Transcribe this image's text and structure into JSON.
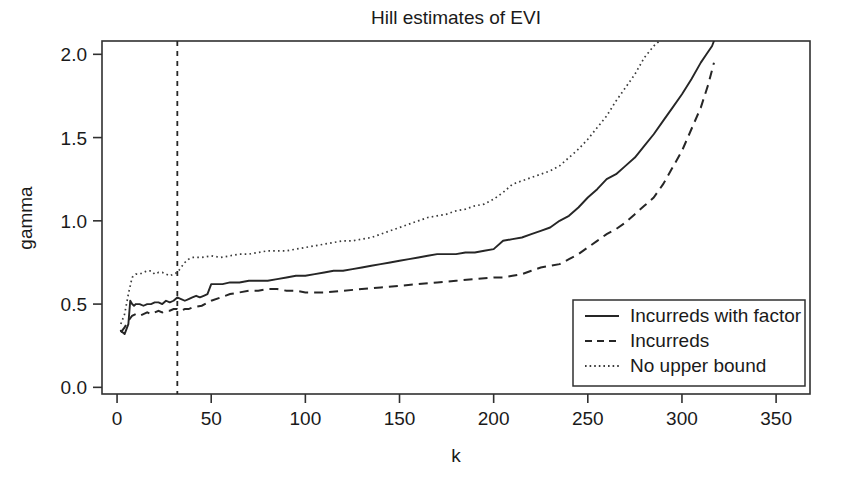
{
  "chart_data": {
    "type": "line",
    "title": "Hill estimates of EVI",
    "xlabel": "k",
    "ylabel": "gamma",
    "xlim": [
      -8,
      368
    ],
    "ylim": [
      -0.04,
      2.08
    ],
    "xticks": [
      0,
      50,
      100,
      150,
      200,
      250,
      300,
      350
    ],
    "xtick_labels": [
      "0",
      "50",
      "100",
      "150",
      "200",
      "250",
      "300",
      "350"
    ],
    "yticks": [
      0.0,
      0.5,
      1.0,
      1.5,
      2.0
    ],
    "ytick_labels": [
      "0.0",
      "0.5",
      "1.0",
      "1.5",
      "2.0"
    ],
    "grid": false,
    "legend_position": "bottom-right",
    "annotations": [
      {
        "kind": "vertical-line",
        "style": "dashed",
        "x": 32,
        "label": "threshold k = 32"
      }
    ],
    "series": [
      {
        "name": "Incurreds with factor",
        "style": "solid",
        "color": "#262626",
        "x": [
          2,
          4,
          6,
          7,
          8,
          9,
          10,
          12,
          14,
          16,
          18,
          20,
          22,
          24,
          26,
          28,
          30,
          32,
          34,
          36,
          38,
          40,
          42,
          44,
          46,
          48,
          50,
          52,
          56,
          60,
          65,
          70,
          75,
          80,
          85,
          90,
          95,
          100,
          105,
          110,
          115,
          120,
          125,
          130,
          135,
          140,
          145,
          150,
          155,
          160,
          165,
          170,
          175,
          180,
          185,
          190,
          195,
          200,
          205,
          210,
          215,
          220,
          225,
          230,
          235,
          240,
          245,
          250,
          255,
          260,
          265,
          270,
          275,
          280,
          285,
          290,
          295,
          300,
          305,
          310,
          313,
          316,
          317
        ],
        "y": [
          0.34,
          0.32,
          0.38,
          0.52,
          0.5,
          0.49,
          0.5,
          0.5,
          0.49,
          0.5,
          0.5,
          0.51,
          0.51,
          0.5,
          0.52,
          0.51,
          0.52,
          0.54,
          0.53,
          0.52,
          0.53,
          0.54,
          0.55,
          0.54,
          0.55,
          0.56,
          0.62,
          0.62,
          0.62,
          0.63,
          0.63,
          0.64,
          0.64,
          0.64,
          0.65,
          0.66,
          0.67,
          0.67,
          0.68,
          0.69,
          0.7,
          0.7,
          0.71,
          0.72,
          0.73,
          0.74,
          0.75,
          0.76,
          0.77,
          0.78,
          0.79,
          0.8,
          0.8,
          0.8,
          0.81,
          0.81,
          0.82,
          0.83,
          0.88,
          0.89,
          0.9,
          0.92,
          0.94,
          0.96,
          1.0,
          1.03,
          1.08,
          1.14,
          1.19,
          1.25,
          1.28,
          1.33,
          1.38,
          1.45,
          1.52,
          1.6,
          1.68,
          1.76,
          1.85,
          1.95,
          2.0,
          2.05,
          2.08
        ]
      },
      {
        "name": "Incurreds",
        "style": "dashed",
        "color": "#262626",
        "x": [
          2,
          4,
          6,
          8,
          10,
          12,
          14,
          16,
          18,
          20,
          22,
          24,
          26,
          28,
          30,
          32,
          34,
          36,
          38,
          40,
          45,
          50,
          55,
          60,
          65,
          70,
          75,
          80,
          85,
          90,
          95,
          100,
          110,
          120,
          130,
          140,
          150,
          160,
          170,
          180,
          190,
          200,
          205,
          210,
          215,
          220,
          225,
          230,
          235,
          240,
          245,
          250,
          255,
          260,
          265,
          270,
          275,
          280,
          285,
          290,
          295,
          300,
          305,
          310,
          314,
          317
        ],
        "y": [
          0.33,
          0.36,
          0.4,
          0.43,
          0.44,
          0.43,
          0.44,
          0.45,
          0.44,
          0.45,
          0.46,
          0.45,
          0.46,
          0.46,
          0.47,
          0.47,
          0.46,
          0.47,
          0.47,
          0.48,
          0.49,
          0.52,
          0.54,
          0.56,
          0.57,
          0.58,
          0.58,
          0.59,
          0.59,
          0.58,
          0.58,
          0.57,
          0.57,
          0.58,
          0.59,
          0.6,
          0.61,
          0.62,
          0.63,
          0.64,
          0.65,
          0.66,
          0.66,
          0.67,
          0.68,
          0.7,
          0.72,
          0.73,
          0.74,
          0.77,
          0.8,
          0.84,
          0.88,
          0.92,
          0.95,
          0.99,
          1.04,
          1.09,
          1.14,
          1.22,
          1.32,
          1.42,
          1.55,
          1.68,
          1.82,
          1.95
        ]
      },
      {
        "name": "No upper bound",
        "style": "dotted",
        "color": "#3a3a3a",
        "x": [
          2,
          4,
          6,
          8,
          10,
          12,
          14,
          16,
          18,
          20,
          22,
          24,
          26,
          28,
          30,
          32,
          34,
          36,
          38,
          40,
          45,
          50,
          55,
          60,
          65,
          70,
          75,
          80,
          85,
          90,
          95,
          100,
          105,
          110,
          115,
          120,
          125,
          130,
          135,
          140,
          145,
          150,
          155,
          160,
          165,
          170,
          175,
          180,
          185,
          190,
          195,
          200,
          205,
          210,
          215,
          220,
          225,
          230,
          235,
          240,
          245,
          250,
          255,
          260,
          265,
          270,
          275,
          280,
          285,
          288
        ],
        "y": [
          0.38,
          0.44,
          0.56,
          0.66,
          0.68,
          0.68,
          0.69,
          0.7,
          0.7,
          0.68,
          0.69,
          0.69,
          0.68,
          0.67,
          0.68,
          0.69,
          0.72,
          0.75,
          0.77,
          0.78,
          0.78,
          0.79,
          0.78,
          0.79,
          0.8,
          0.8,
          0.81,
          0.82,
          0.82,
          0.82,
          0.83,
          0.84,
          0.85,
          0.86,
          0.87,
          0.88,
          0.88,
          0.89,
          0.9,
          0.92,
          0.94,
          0.96,
          0.98,
          1.0,
          1.02,
          1.03,
          1.04,
          1.06,
          1.07,
          1.09,
          1.1,
          1.13,
          1.17,
          1.22,
          1.24,
          1.26,
          1.28,
          1.3,
          1.33,
          1.38,
          1.43,
          1.49,
          1.56,
          1.63,
          1.72,
          1.8,
          1.88,
          1.98,
          2.05,
          2.08
        ]
      }
    ]
  },
  "legend": {
    "entries": [
      {
        "label": "Incurreds with factor",
        "style": "solid"
      },
      {
        "label": "Incurreds",
        "style": "dashed"
      },
      {
        "label": "No upper bound",
        "style": "dotted"
      }
    ]
  },
  "colors": {
    "background": "#ffffff",
    "axis": "#303030",
    "series_primary": "#262626",
    "series_tertiary": "#3a3a3a"
  }
}
